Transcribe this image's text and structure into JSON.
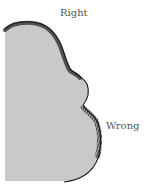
{
  "diagram": {
    "labels": {
      "right": "Right",
      "wrong": "Wrong"
    },
    "colors": {
      "fill": "#c9c9c9",
      "edge": "#2a2a2a",
      "label": "#555555",
      "background": "#ffffff"
    }
  }
}
